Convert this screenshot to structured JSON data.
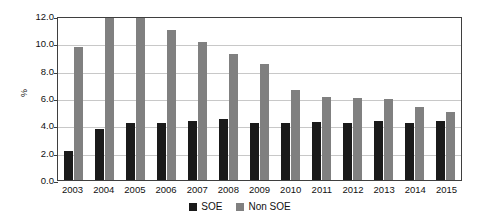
{
  "chart_data": {
    "type": "bar",
    "title": "",
    "xlabel": "",
    "ylabel": "%",
    "ylim": [
      0.0,
      12.0
    ],
    "ytick_step": 2.0,
    "ytick_labels": [
      "12.0",
      "10.0",
      "8.0",
      "6.0",
      "4.0",
      "2.0",
      "0.0"
    ],
    "ytick_values": [
      12.0,
      10.0,
      8.0,
      6.0,
      4.0,
      2.0,
      0.0
    ],
    "grid": true,
    "legend_position": "bottom-center",
    "categories": [
      "2003",
      "2004",
      "2005",
      "2006",
      "2007",
      "2008",
      "2009",
      "2010",
      "2011",
      "2012",
      "2013",
      "2014",
      "2015"
    ],
    "series": [
      {
        "name": "SOE",
        "color": "#1a1a1a",
        "values": [
          2.1,
          3.7,
          4.2,
          4.15,
          4.3,
          4.5,
          4.2,
          4.2,
          4.25,
          4.2,
          4.3,
          4.15,
          4.3
        ]
      },
      {
        "name": "Non SOE",
        "color": "#808080",
        "values": [
          9.75,
          11.85,
          11.85,
          11.0,
          10.1,
          9.25,
          8.5,
          6.6,
          6.1,
          6.0,
          5.9,
          5.35,
          5.0
        ]
      }
    ]
  },
  "colors": {
    "soe": "#1a1a1a",
    "non_soe": "#808080",
    "grid": "#c8c8c8",
    "axis": "#3f3f3f",
    "background": "#ffffff"
  }
}
